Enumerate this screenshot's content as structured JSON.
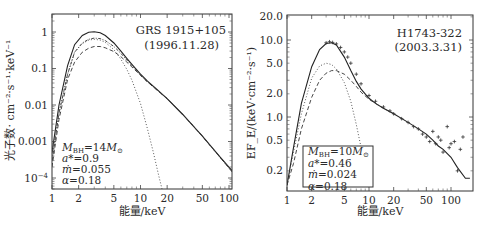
{
  "chart_data": [
    {
      "type": "line",
      "title": "GRS 1915+105",
      "subtitle": "(1996.11.28)",
      "xlabel": "能量/keV",
      "ylabel": "光子数· cm⁻²·s⁻¹·keV⁻¹",
      "xscale": "log",
      "yscale": "log",
      "xlim": [
        1,
        120
      ],
      "ylim": [
        5e-05,
        2.5
      ],
      "x_ticks": [
        "1",
        "2",
        "5",
        "10",
        "20",
        "50",
        "100"
      ],
      "y_ticks": [
        "1",
        "0.1",
        "0.01",
        "0.001",
        "10⁻⁴"
      ],
      "grid": false,
      "annotation": [
        "M_BH=14M⊙",
        "a*=0.9",
        "ṁ=0.055",
        "α=0.18"
      ],
      "series": [
        {
          "name": "total model",
          "style": "solid",
          "x": [
            1.0,
            1.2,
            1.5,
            1.8,
            2.2,
            2.6,
            3.0,
            3.5,
            4.0,
            5.0,
            6.0,
            7.0,
            8.0,
            10,
            12,
            15,
            20,
            30,
            50,
            80,
            120
          ],
          "y": [
            0.0005,
            0.01,
            0.12,
            0.45,
            0.8,
            0.98,
            1.02,
            0.95,
            0.8,
            0.5,
            0.3,
            0.19,
            0.13,
            0.07,
            0.045,
            0.028,
            0.015,
            0.0055,
            0.0014,
            0.00037,
            0.00012
          ]
        },
        {
          "name": "data",
          "style": "dashdot",
          "x": [
            1.0,
            1.2,
            1.5,
            1.8,
            2.2,
            2.6,
            3.0,
            3.5,
            4.0,
            5.0,
            6.0,
            7.0,
            8.0,
            10,
            12,
            15,
            20,
            30,
            50,
            80,
            120
          ],
          "y": [
            0.0003,
            0.006,
            0.07,
            0.28,
            0.5,
            0.63,
            0.68,
            0.66,
            0.58,
            0.4,
            0.26,
            0.17,
            0.12,
            0.065,
            0.043,
            0.027,
            0.015,
            0.0056,
            0.0014,
            0.00036,
            0.00011
          ]
        },
        {
          "name": "disk component",
          "style": "dotted",
          "x": [
            1.0,
            1.2,
            1.5,
            1.8,
            2.2,
            2.6,
            3.0,
            3.5,
            4.0,
            5.0,
            6.0,
            7.0,
            8.0,
            10,
            12,
            14,
            16,
            17.5
          ],
          "y": [
            0.0003,
            0.006,
            0.07,
            0.28,
            0.48,
            0.6,
            0.63,
            0.6,
            0.52,
            0.33,
            0.18,
            0.095,
            0.048,
            0.011,
            0.0022,
            0.0005,
            0.00012,
            5e-05
          ]
        },
        {
          "name": "corona component",
          "style": "dashed",
          "x": [
            1.0,
            1.2,
            1.5,
            1.8,
            2.2,
            2.6,
            3.0,
            3.5,
            4.0,
            5.0,
            6.0,
            7.0,
            8.0,
            10,
            12,
            15,
            20,
            30,
            50,
            80,
            120
          ],
          "y": [
            0.0002,
            0.004,
            0.05,
            0.15,
            0.28,
            0.36,
            0.4,
            0.4,
            0.37,
            0.29,
            0.21,
            0.15,
            0.11,
            0.065,
            0.043,
            0.027,
            0.015,
            0.0055,
            0.0014,
            0.00036,
            0.00011
          ]
        }
      ]
    },
    {
      "type": "line",
      "title": "H1743-322",
      "subtitle": "(2003.3.31)",
      "xlabel": "能量/keV",
      "ylabel": "EF_E/(keV·cm⁻²·s⁻¹)",
      "xscale": "log",
      "yscale": "log",
      "xlim": [
        1,
        170
      ],
      "ylim": [
        0.13,
        20
      ],
      "x_ticks": [
        "1",
        "2",
        "5",
        "10",
        "20",
        "50",
        "100"
      ],
      "y_ticks": [
        "20.0",
        "10.0",
        "5.0",
        "2.0",
        "1.0",
        "0.5",
        "0.2"
      ],
      "grid": false,
      "annotation": [
        "M_BH=10M⊙",
        "a*=0.46",
        "ṁ=0.024",
        "α=0.18"
      ],
      "series": [
        {
          "name": "total model",
          "style": "solid",
          "x": [
            1.0,
            1.2,
            1.5,
            2.0,
            2.5,
            3.0,
            3.5,
            4.0,
            5.0,
            6.0,
            7.0,
            8.0,
            10,
            12,
            15,
            20,
            30,
            40,
            50,
            60,
            70,
            80,
            100,
            120,
            150,
            170
          ],
          "y": [
            0.13,
            0.4,
            1.5,
            4.5,
            7.5,
            9.0,
            9.2,
            8.6,
            6.0,
            4.0,
            2.9,
            2.3,
            1.75,
            1.5,
            1.3,
            1.1,
            0.85,
            0.7,
            0.6,
            0.5,
            0.42,
            0.38,
            0.3,
            0.22,
            0.16,
            0.16
          ]
        },
        {
          "name": "data",
          "style": "points",
          "x": [
            3.0,
            3.3,
            3.6,
            4.0,
            4.5,
            5.0,
            5.5,
            6.0,
            7.0,
            8.0,
            10,
            12,
            15,
            18,
            20,
            25,
            30,
            35,
            40,
            45,
            50,
            55,
            60,
            65,
            70,
            75,
            80,
            90,
            95,
            100,
            110,
            120,
            130,
            140
          ],
          "y": [
            9.2,
            9.5,
            9.3,
            8.9,
            8.0,
            7.0,
            6.0,
            5.0,
            3.6,
            2.7,
            1.9,
            1.6,
            1.35,
            1.2,
            1.1,
            0.95,
            0.85,
            0.75,
            0.7,
            0.6,
            0.55,
            0.48,
            0.65,
            0.45,
            0.55,
            0.5,
            0.35,
            0.75,
            0.4,
            0.45,
            0.48,
            0.2,
            0.38,
            0.55
          ]
        },
        {
          "name": "disk component",
          "style": "dotted",
          "x": [
            1.0,
            1.2,
            1.5,
            2.0,
            2.5,
            3.0,
            3.5,
            4.0,
            5.0,
            6.0,
            7.0,
            8.0,
            9.0,
            10
          ],
          "y": [
            0.13,
            0.35,
            1.1,
            3.2,
            4.6,
            5.0,
            4.8,
            4.2,
            2.8,
            1.6,
            0.8,
            0.4,
            0.19,
            0.13
          ]
        },
        {
          "name": "corona component",
          "style": "dashed",
          "x": [
            1.0,
            1.2,
            1.5,
            2.0,
            2.5,
            3.0,
            3.5,
            4.0,
            5.0,
            6.0,
            7.0,
            8.0,
            10,
            12,
            15,
            20
          ],
          "y": [
            0.13,
            0.25,
            0.7,
            1.8,
            3.0,
            3.7,
            4.0,
            4.0,
            3.6,
            3.0,
            2.5,
            2.1,
            1.7,
            1.5,
            1.3,
            1.1
          ]
        }
      ]
    }
  ],
  "left_panel": {
    "title": "GRS 1915+105",
    "date": "(1996.11.28)",
    "xlabel": "能量/keV",
    "ylabel": "光子数· cm⁻²·s⁻¹·keV⁻¹",
    "params": [
      "M_BH=14M⊙",
      "a*=0.9",
      "ṁ=0.055",
      "α=0.18"
    ]
  },
  "right_panel": {
    "title": "H1743-322",
    "date": "(2003.3.31)",
    "xlabel": "能量/keV",
    "ylabel": "EF_E/(keV·cm⁻²·s⁻¹)",
    "params": [
      "M_BH=10M⊙",
      "a*=0.46",
      "ṁ=0.024",
      "α=0.18"
    ]
  }
}
